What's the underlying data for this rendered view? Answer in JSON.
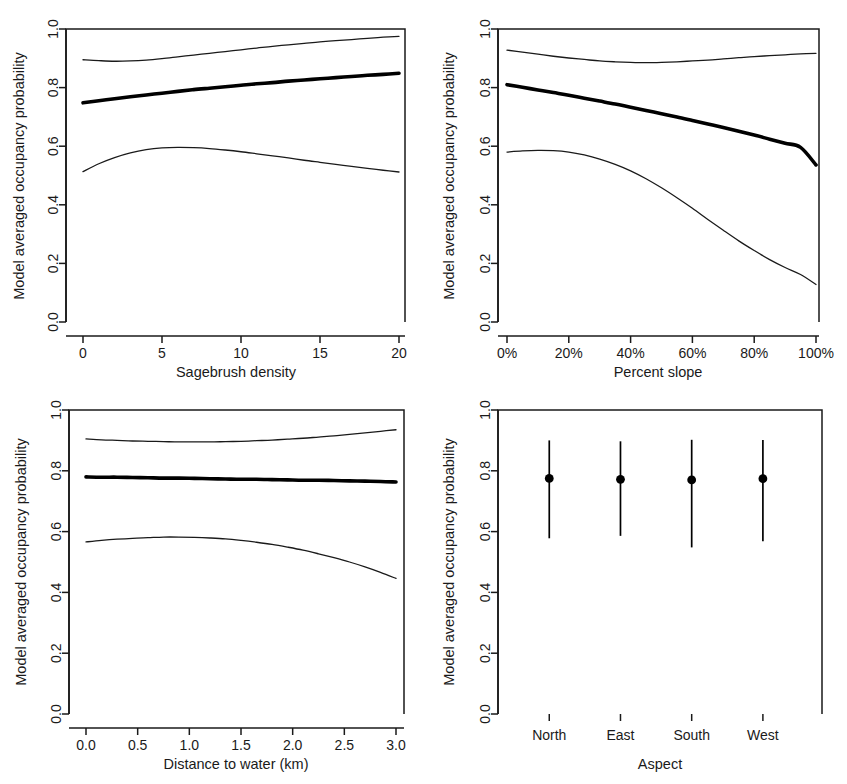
{
  "figure": {
    "shared_ylabel": "Model averaged occupancy probability",
    "y_ticks": [
      "0.0",
      "0.2",
      "0.4",
      "0.6",
      "0.8",
      "1.0"
    ],
    "y_tick_values": [
      0.0,
      0.2,
      0.4,
      0.6,
      0.8,
      1.0
    ],
    "line_color": "#000000",
    "background_color": "#ffffff"
  },
  "chart_data": [
    {
      "id": "sagebrush-density",
      "type": "line",
      "title": "",
      "xlabel": "Sagebrush density",
      "ylabel": "Model averaged occupancy probability",
      "xlim": [
        0,
        20
      ],
      "ylim": [
        0,
        1
      ],
      "xticks": [
        0,
        5,
        10,
        15,
        20
      ],
      "xticklabels": [
        "0",
        "5",
        "10",
        "15",
        "20"
      ],
      "yticks": [
        0.0,
        0.2,
        0.4,
        0.6,
        0.8,
        1.0
      ],
      "yticklabels": [
        "0.0",
        "0.2",
        "0.4",
        "0.6",
        "0.8",
        "1.0"
      ],
      "grid": false,
      "legend": "none",
      "x": [
        0,
        1,
        2,
        3,
        4,
        5,
        6,
        7,
        8,
        9,
        10,
        11,
        12,
        13,
        14,
        15,
        16,
        17,
        18,
        19,
        20
      ],
      "series": [
        {
          "name": "Upper 95% confidence limit",
          "style": "thin",
          "values": [
            0.895,
            0.892,
            0.89,
            0.891,
            0.894,
            0.899,
            0.905,
            0.911,
            0.917,
            0.923,
            0.929,
            0.935,
            0.941,
            0.946,
            0.951,
            0.956,
            0.96,
            0.964,
            0.968,
            0.972,
            0.975
          ]
        },
        {
          "name": "Model averaged estimate",
          "style": "thick",
          "values": [
            0.748,
            0.755,
            0.762,
            0.769,
            0.775,
            0.781,
            0.787,
            0.793,
            0.798,
            0.803,
            0.808,
            0.813,
            0.817,
            0.822,
            0.826,
            0.83,
            0.834,
            0.838,
            0.842,
            0.845,
            0.849
          ]
        },
        {
          "name": "Lower 95% confidence limit",
          "style": "thin",
          "values": [
            0.513,
            0.54,
            0.561,
            0.577,
            0.588,
            0.594,
            0.596,
            0.595,
            0.592,
            0.587,
            0.581,
            0.574,
            0.567,
            0.56,
            0.552,
            0.545,
            0.538,
            0.531,
            0.524,
            0.518,
            0.512
          ]
        }
      ]
    },
    {
      "id": "percent-slope",
      "type": "line",
      "title": "",
      "xlabel": "Percent slope",
      "ylabel": "Model averaged occupancy probability",
      "xlim": [
        0,
        100
      ],
      "ylim": [
        0,
        1
      ],
      "xticks": [
        0,
        20,
        40,
        60,
        80,
        100
      ],
      "xticklabels": [
        "0%",
        "20%",
        "40%",
        "60%",
        "80%",
        "100%"
      ],
      "yticks": [
        0.0,
        0.2,
        0.4,
        0.6,
        0.8,
        1.0
      ],
      "yticklabels": [
        "0.0",
        "0.2",
        "0.4",
        "0.6",
        "0.8",
        "1.0"
      ],
      "grid": false,
      "legend": "none",
      "x": [
        0,
        5,
        10,
        15,
        20,
        25,
        30,
        35,
        40,
        45,
        50,
        55,
        60,
        65,
        70,
        75,
        80,
        85,
        90,
        95,
        100
      ],
      "series": [
        {
          "name": "Upper 95% confidence limit",
          "style": "thin",
          "values": [
            0.928,
            0.921,
            0.914,
            0.907,
            0.901,
            0.896,
            0.891,
            0.888,
            0.886,
            0.885,
            0.886,
            0.888,
            0.891,
            0.894,
            0.898,
            0.902,
            0.906,
            0.909,
            0.912,
            0.915,
            0.917
          ]
        },
        {
          "name": "Model averaged estimate",
          "style": "thick",
          "values": [
            0.81,
            0.801,
            0.792,
            0.783,
            0.774,
            0.764,
            0.754,
            0.744,
            0.733,
            0.722,
            0.711,
            0.7,
            0.688,
            0.676,
            0.664,
            0.651,
            0.638,
            0.624,
            0.61,
            0.596,
            0.536
          ]
        },
        {
          "name": "Lower 95% confidence limit",
          "style": "thin",
          "values": [
            0.58,
            0.584,
            0.586,
            0.585,
            0.58,
            0.57,
            0.556,
            0.538,
            0.516,
            0.489,
            0.458,
            0.424,
            0.388,
            0.35,
            0.313,
            0.277,
            0.244,
            0.213,
            0.186,
            0.162,
            0.128
          ]
        }
      ]
    },
    {
      "id": "distance-to-water",
      "type": "line",
      "title": "",
      "xlabel": "Distance to water (km)",
      "ylabel": "Model averaged occupancy probability",
      "xlim": [
        0,
        3
      ],
      "ylim": [
        0,
        1
      ],
      "xticks": [
        0.0,
        0.5,
        1.0,
        1.5,
        2.0,
        2.5,
        3.0
      ],
      "xticklabels": [
        "0.0",
        "0.5",
        "1.0",
        "1.5",
        "2.0",
        "2.5",
        "3.0"
      ],
      "yticks": [
        0.0,
        0.2,
        0.4,
        0.6,
        0.8,
        1.0
      ],
      "yticklabels": [
        "0.0",
        "0.2",
        "0.4",
        "0.6",
        "0.8",
        "1.0"
      ],
      "grid": false,
      "legend": "none",
      "x": [
        0.0,
        0.15,
        0.3,
        0.45,
        0.6,
        0.75,
        0.9,
        1.05,
        1.2,
        1.35,
        1.5,
        1.65,
        1.8,
        1.95,
        2.1,
        2.25,
        2.4,
        2.55,
        2.7,
        2.85,
        3.0
      ],
      "series": [
        {
          "name": "Upper 95% confidence limit",
          "style": "thin",
          "values": [
            0.905,
            0.902,
            0.9,
            0.898,
            0.897,
            0.896,
            0.895,
            0.895,
            0.895,
            0.896,
            0.897,
            0.899,
            0.901,
            0.904,
            0.907,
            0.911,
            0.915,
            0.92,
            0.925,
            0.93,
            0.935
          ]
        },
        {
          "name": "Model averaged estimate",
          "style": "thick",
          "values": [
            0.78,
            0.779,
            0.779,
            0.778,
            0.777,
            0.776,
            0.776,
            0.775,
            0.774,
            0.773,
            0.772,
            0.772,
            0.771,
            0.77,
            0.769,
            0.769,
            0.768,
            0.767,
            0.766,
            0.765,
            0.763
          ]
        },
        {
          "name": "Lower 95% confidence limit",
          "style": "thin",
          "values": [
            0.566,
            0.571,
            0.575,
            0.578,
            0.58,
            0.582,
            0.582,
            0.581,
            0.579,
            0.576,
            0.571,
            0.565,
            0.558,
            0.549,
            0.539,
            0.527,
            0.514,
            0.5,
            0.484,
            0.466,
            0.446
          ]
        }
      ]
    },
    {
      "id": "aspect",
      "type": "scatter",
      "title": "",
      "xlabel": "Aspect",
      "ylabel": "Model averaged occupancy probability",
      "ylim": [
        0,
        1
      ],
      "yticks": [
        0.0,
        0.2,
        0.4,
        0.6,
        0.8,
        1.0
      ],
      "yticklabels": [
        "0.0",
        "0.2",
        "0.4",
        "0.6",
        "0.8",
        "1.0"
      ],
      "grid": false,
      "legend": "none",
      "categories": [
        "North",
        "East",
        "South",
        "West"
      ],
      "values": [
        0.775,
        0.772,
        0.77,
        0.774
      ],
      "error_upper": [
        0.9,
        0.897,
        0.902,
        0.901
      ],
      "error_lower": [
        0.578,
        0.586,
        0.548,
        0.568
      ]
    }
  ]
}
